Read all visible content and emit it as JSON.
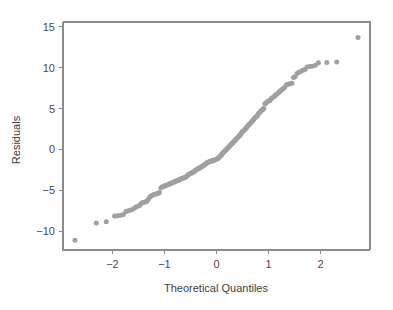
{
  "figure": {
    "background_color": "#ffffff",
    "point_color": "#a0a0a0",
    "axis_color": "#8c8c8c",
    "text_color": "#3d3d3d"
  },
  "chart_data": {
    "type": "scatter",
    "title": "",
    "subtitle": "",
    "xlabel": "Theoretical Quantiles",
    "ylabel": "Residuals",
    "xlim": [
      -2.95,
      2.95
    ],
    "ylim": [
      -12.3,
      15.6
    ],
    "grid": false,
    "legend": null,
    "xticks": [
      -2,
      -1,
      0,
      1,
      2
    ],
    "xticklabels": [
      "-2",
      "-1",
      "0",
      "1",
      "2"
    ],
    "yticks": [
      -10,
      -5,
      0,
      5,
      10,
      15
    ],
    "yticklabels": [
      "-10",
      "-5",
      "0",
      "5",
      "10",
      "15"
    ],
    "annotations": [],
    "series": [
      {
        "name": "Normal Q-Q residuals",
        "marker": "filled-circle",
        "color": "#a0a0a0",
        "x": [
          -2.72,
          -2.31,
          -2.12,
          -1.96,
          -1.9,
          -1.84,
          -1.79,
          -1.74,
          -1.7,
          -1.66,
          -1.62,
          -1.58,
          -1.55,
          -1.51,
          -1.48,
          -1.45,
          -1.42,
          -1.39,
          -1.36,
          -1.34,
          -1.31,
          -1.28,
          -1.26,
          -1.23,
          -1.21,
          -1.19,
          -1.16,
          -1.14,
          -1.12,
          -1.1,
          -1.07,
          -1.05,
          -1.03,
          -1.01,
          -0.99,
          -0.97,
          -0.95,
          -0.93,
          -0.91,
          -0.9,
          -0.88,
          -0.86,
          -0.84,
          -0.82,
          -0.8,
          -0.79,
          -0.77,
          -0.75,
          -0.73,
          -0.72,
          -0.7,
          -0.68,
          -0.67,
          -0.65,
          -0.63,
          -0.62,
          -0.6,
          -0.58,
          -0.57,
          -0.55,
          -0.54,
          -0.52,
          -0.5,
          -0.49,
          -0.47,
          -0.46,
          -0.44,
          -0.43,
          -0.41,
          -0.4,
          -0.38,
          -0.37,
          -0.35,
          -0.34,
          -0.32,
          -0.31,
          -0.29,
          -0.28,
          -0.26,
          -0.25,
          -0.23,
          -0.22,
          -0.2,
          -0.19,
          -0.17,
          -0.16,
          -0.14,
          -0.13,
          -0.11,
          -0.1,
          -0.09,
          -0.07,
          -0.06,
          -0.04,
          -0.03,
          -0.01,
          0.01,
          0.03,
          0.04,
          0.06,
          0.07,
          0.09,
          0.1,
          0.11,
          0.13,
          0.14,
          0.16,
          0.17,
          0.19,
          0.2,
          0.22,
          0.23,
          0.25,
          0.26,
          0.28,
          0.29,
          0.31,
          0.32,
          0.34,
          0.35,
          0.37,
          0.38,
          0.4,
          0.41,
          0.43,
          0.44,
          0.46,
          0.47,
          0.49,
          0.5,
          0.52,
          0.54,
          0.55,
          0.57,
          0.58,
          0.6,
          0.62,
          0.63,
          0.65,
          0.67,
          0.68,
          0.7,
          0.72,
          0.73,
          0.75,
          0.77,
          0.79,
          0.8,
          0.82,
          0.84,
          0.86,
          0.88,
          0.9,
          0.91,
          0.93,
          0.95,
          0.97,
          0.99,
          1.01,
          1.03,
          1.05,
          1.07,
          1.1,
          1.12,
          1.14,
          1.16,
          1.19,
          1.21,
          1.23,
          1.26,
          1.28,
          1.31,
          1.34,
          1.36,
          1.39,
          1.42,
          1.45,
          1.48,
          1.51,
          1.55,
          1.58,
          1.62,
          1.66,
          1.7,
          1.74,
          1.79,
          1.84,
          1.9,
          1.96,
          2.12,
          2.31,
          2.72
        ],
        "y": [
          -11.1,
          -9.0,
          -8.85,
          -8.15,
          -8.1,
          -8.05,
          -7.95,
          -7.6,
          -7.5,
          -7.45,
          -7.35,
          -7.2,
          -7.05,
          -6.95,
          -6.85,
          -6.6,
          -6.5,
          -6.45,
          -6.4,
          -6.35,
          -6.1,
          -5.8,
          -5.7,
          -5.6,
          -5.55,
          -5.5,
          -5.45,
          -5.4,
          -5.35,
          -5.25,
          -4.7,
          -4.6,
          -4.55,
          -4.5,
          -4.45,
          -4.4,
          -4.35,
          -4.3,
          -4.25,
          -4.2,
          -4.15,
          -4.1,
          -4.05,
          -4.0,
          -3.95,
          -3.9,
          -3.85,
          -3.8,
          -3.75,
          -3.7,
          -3.65,
          -3.6,
          -3.55,
          -3.5,
          -3.48,
          -3.45,
          -3.4,
          -3.35,
          -3.25,
          -3.15,
          -3.05,
          -3.0,
          -2.95,
          -2.9,
          -2.85,
          -2.8,
          -2.75,
          -2.7,
          -2.6,
          -2.5,
          -2.45,
          -2.4,
          -2.35,
          -2.3,
          -2.25,
          -2.2,
          -2.15,
          -2.05,
          -2.0,
          -1.95,
          -1.9,
          -1.8,
          -1.7,
          -1.65,
          -1.6,
          -1.55,
          -1.5,
          -1.48,
          -1.45,
          -1.42,
          -1.4,
          -1.38,
          -1.35,
          -1.3,
          -1.25,
          -1.2,
          -1.15,
          -1.1,
          -1.0,
          -0.9,
          -0.8,
          -0.7,
          -0.6,
          -0.5,
          -0.4,
          -0.3,
          -0.2,
          -0.1,
          0.0,
          0.1,
          0.2,
          0.3,
          0.4,
          0.5,
          0.6,
          0.7,
          0.8,
          0.9,
          1.0,
          1.1,
          1.2,
          1.3,
          1.4,
          1.5,
          1.6,
          1.7,
          1.8,
          1.95,
          2.1,
          2.2,
          2.3,
          2.4,
          2.5,
          2.6,
          2.75,
          2.9,
          3.0,
          3.1,
          3.2,
          3.35,
          3.45,
          3.55,
          3.7,
          3.85,
          3.95,
          4.05,
          4.2,
          4.35,
          4.5,
          4.6,
          4.75,
          4.85,
          4.95,
          5.0,
          5.6,
          5.7,
          5.8,
          5.9,
          5.95,
          6.0,
          6.2,
          6.3,
          6.45,
          6.55,
          6.7,
          6.8,
          6.95,
          7.05,
          7.2,
          7.35,
          7.45,
          7.6,
          7.9,
          7.95,
          8.0,
          8.05,
          8.1,
          8.8,
          8.9,
          9.3,
          9.45,
          9.55,
          9.7,
          9.8,
          10.1,
          10.15,
          10.2,
          10.3,
          10.6,
          10.65,
          10.7,
          13.7
        ]
      }
    ]
  }
}
